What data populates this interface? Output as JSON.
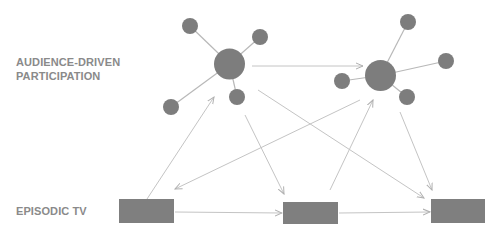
{
  "labels": {
    "top_line1": "AUDIENCE-DRIVEN",
    "top_line2": "PARTICIPATION",
    "bottom": "EPISODIC TV"
  },
  "colors": {
    "node": "#7d7d7d",
    "spoke": "#b8b8b8",
    "arrow": "#c4c4c4",
    "rect": "#7f7f7f",
    "text": "#8a8a8a"
  },
  "clusters": [
    {
      "name": "left",
      "hub": {
        "cx": 229.5,
        "cy": 64,
        "r": 15.5
      },
      "satellites": [
        {
          "cx": 190,
          "cy": 26,
          "r": 8
        },
        {
          "cx": 260,
          "cy": 37,
          "r": 8
        },
        {
          "cx": 237,
          "cy": 97,
          "r": 8
        },
        {
          "cx": 171,
          "cy": 107,
          "r": 8
        }
      ]
    },
    {
      "name": "right",
      "hub": {
        "cx": 380.5,
        "cy": 75.5,
        "r": 15.5
      },
      "satellites": [
        {
          "cx": 408,
          "cy": 22,
          "r": 8
        },
        {
          "cx": 446,
          "cy": 61,
          "r": 8
        },
        {
          "cx": 342,
          "cy": 81,
          "r": 8
        },
        {
          "cx": 407,
          "cy": 97,
          "r": 8
        }
      ]
    }
  ],
  "episodes": [
    {
      "x": 119,
      "y": 199,
      "w": 55,
      "h": 24
    },
    {
      "x": 283,
      "y": 202,
      "w": 55,
      "h": 22
    },
    {
      "x": 431,
      "y": 199,
      "w": 54,
      "h": 24
    }
  ],
  "arrows": [
    {
      "from": "left-hub",
      "to": "right-hub",
      "x1": 252,
      "y1": 66,
      "x2": 363,
      "y2": 66
    },
    {
      "from": "episode-1",
      "to": "left-hub",
      "x1": 147,
      "y1": 199,
      "x2": 214,
      "y2": 97
    },
    {
      "from": "left-hub",
      "to": "episode-2",
      "x1": 245,
      "y1": 115,
      "x2": 284,
      "y2": 194
    },
    {
      "from": "right-hub",
      "to": "episode-1",
      "x1": 360,
      "y1": 100,
      "x2": 175,
      "y2": 189
    },
    {
      "from": "left-hub",
      "to": "episode-3",
      "x1": 258,
      "y1": 90,
      "x2": 424,
      "y2": 198
    },
    {
      "from": "episode-2",
      "to": "right-hub",
      "x1": 330,
      "y1": 190,
      "x2": 373,
      "y2": 100
    },
    {
      "from": "right-hub",
      "to": "episode-3",
      "x1": 400,
      "y1": 112,
      "x2": 432,
      "y2": 190
    },
    {
      "from": "episode-1",
      "to": "episode-2",
      "x1": 175,
      "y1": 212,
      "x2": 282,
      "y2": 213
    },
    {
      "from": "episode-2",
      "to": "episode-3",
      "x1": 339,
      "y1": 213,
      "x2": 430,
      "y2": 212
    }
  ]
}
